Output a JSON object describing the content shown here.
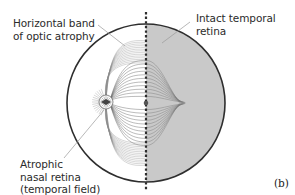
{
  "figure": {
    "panel_label": "(b)",
    "colors": {
      "background": "#ffffff",
      "intact_half": "#c9c9c9",
      "outline": "#2e2e2e",
      "fibers": "#6a6a6a",
      "leader": "#9a9a9a",
      "text": "#2b2b2b"
    },
    "labels": {
      "band": [
        "Horizontal band",
        "of optic atrophy"
      ],
      "intact": [
        "Intact temporal",
        "retina"
      ],
      "nasal": [
        "Atrophic",
        "nasal retina",
        "(temporal field)"
      ]
    },
    "regions": [
      {
        "name": "Atrophic nasal retina",
        "side": "left",
        "shaded": false
      },
      {
        "name": "Intact temporal retina",
        "side": "right",
        "shaded": true
      }
    ],
    "midline": "vertical dashed line"
  }
}
